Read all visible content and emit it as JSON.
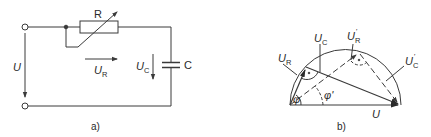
{
  "figure_a": {
    "caption": "a)",
    "labels": {
      "resistor": "R",
      "source_voltage": "U",
      "resistor_voltage_main": "U",
      "resistor_voltage_sub": "R",
      "capacitor_voltage_main": "U",
      "capacitor_voltage_sub": "C",
      "capacitor": "C"
    }
  },
  "figure_b": {
    "caption": "b)",
    "labels": {
      "u_r_main": "U",
      "u_r_sub": "R",
      "u_c_main": "U",
      "u_c_sub": "C",
      "u_r_prime_main": "U",
      "u_r_prime_sub": "R",
      "u_r_prime_mark": "'",
      "u_c_prime_main": "U",
      "u_c_prime_sub": "C",
      "u_c_prime_mark": "'",
      "phi": "φ",
      "phi_prime": "φ'",
      "u_total": "U"
    }
  },
  "colors": {
    "line": "#3a3a3a",
    "background": "#ffffff"
  }
}
